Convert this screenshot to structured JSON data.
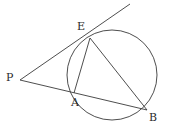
{
  "figure": {
    "kind": "euclidean-geometry-diagram",
    "background_color": "#ffffff",
    "stroke_color": "#3a3a3a",
    "label_color": "#2b2b2b",
    "stroke_width": 0.9,
    "width": 172,
    "height": 131
  },
  "circle": {
    "name": "main-circle",
    "cx": 112,
    "cy": 75,
    "r": 45
  },
  "points": [
    {
      "id": "P",
      "label": "P",
      "x": 20,
      "y": 80,
      "label_x": 6,
      "label_y": 72,
      "on_circle": false
    },
    {
      "id": "E",
      "label": "E",
      "x": 90,
      "y": 38,
      "label_x": 77,
      "label_y": 21,
      "on_circle": true
    },
    {
      "id": "A",
      "label": "A",
      "x": 74,
      "y": 93,
      "label_x": 71,
      "label_y": 97,
      "on_circle": true
    },
    {
      "id": "B",
      "label": "B",
      "x": 147,
      "y": 110,
      "label_x": 149,
      "label_y": 112,
      "on_circle": true
    }
  ],
  "segments": [
    {
      "id": "tangent-ray-PE",
      "from": "P",
      "to": "tangent-end",
      "x1": 20,
      "y1": 80,
      "x2": 130,
      "y2": 4
    },
    {
      "id": "secant-PB",
      "from": "P",
      "to": "B",
      "x1": 20,
      "y1": 80,
      "x2": 147,
      "y2": 110
    },
    {
      "id": "chord-EA",
      "from": "E",
      "to": "A",
      "x1": 90,
      "y1": 38,
      "x2": 74,
      "y2": 93
    },
    {
      "id": "chord-EB",
      "from": "E",
      "to": "B",
      "x1": 90,
      "y1": 38,
      "x2": 147,
      "y2": 110
    }
  ],
  "tangent_end": {
    "x": 130,
    "y": 4
  }
}
